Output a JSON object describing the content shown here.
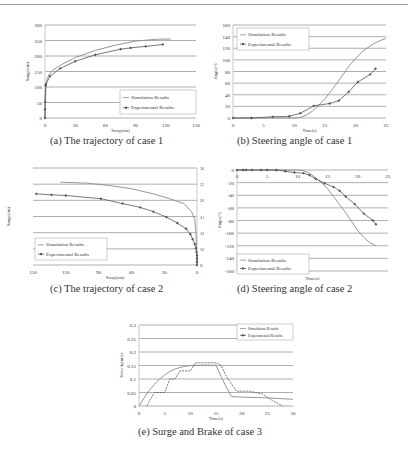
{
  "captions": {
    "a": "(a)  The trajectory of case 1",
    "b": "(b)  Steering angle of case 1",
    "c": "(c)  The trajectory of case 2",
    "d": "(d)  Steering angle of case 2",
    "e": "(e)  Surge and Brake of case 3"
  },
  "legend": {
    "sim": "Simulation Results",
    "exp": "Experimental Results"
  },
  "colors": {
    "simulation": "#8a8a8a",
    "experimental": "#555555",
    "grid": "#9a9a9a",
    "axis": "#bbbbbb"
  },
  "chart_data": [
    {
      "id": "a",
      "type": "line",
      "title": "The trajectory of case 1",
      "xlabel": "Sway(cm)",
      "ylabel": "Surge(cm)",
      "xlim": [
        0,
        150
      ],
      "ylim": [
        0,
        300
      ],
      "xticks": [
        0,
        30,
        60,
        90,
        120,
        150
      ],
      "yticks": [
        0,
        50,
        100,
        150,
        200,
        250,
        300
      ],
      "grid": "horizontal",
      "legend_position": "lower right",
      "series": [
        {
          "name": "Simulation Results",
          "marker": "none",
          "x": [
            0,
            0.5,
            1,
            2,
            4,
            8,
            15,
            30,
            50,
            70,
            90,
            110,
            125
          ],
          "y": [
            0,
            60,
            100,
            125,
            140,
            155,
            170,
            195,
            218,
            235,
            248,
            254,
            255
          ]
        },
        {
          "name": "Experimental Results",
          "marker": "diamond",
          "x": [
            0,
            0,
            0,
            0.5,
            1,
            5,
            15,
            30,
            50,
            75,
            85,
            100,
            117
          ],
          "y": [
            0,
            28,
            52,
            105,
            110,
            135,
            160,
            183,
            204,
            222,
            226,
            231,
            237
          ]
        }
      ]
    },
    {
      "id": "b",
      "type": "line",
      "title": "Steering angle of case 1",
      "xlabel": "Time(s)",
      "ylabel": "Angle(°)",
      "xlim": [
        0,
        25
      ],
      "ylim": [
        0,
        160
      ],
      "xticks": [
        0,
        5,
        10,
        15,
        20,
        25
      ],
      "yticks": [
        0,
        20,
        40,
        60,
        80,
        100,
        120,
        140,
        160
      ],
      "grid": "horizontal",
      "legend_position": "upper left",
      "series": [
        {
          "name": "Simulation Results",
          "marker": "none",
          "x": [
            0,
            5,
            10,
            11,
            12,
            13,
            14,
            15,
            16,
            17,
            18,
            19,
            20,
            21,
            22,
            23,
            24,
            25
          ],
          "y": [
            0,
            0,
            0,
            1,
            5,
            12,
            22,
            33,
            46,
            60,
            75,
            90,
            102,
            113,
            121,
            128,
            133,
            137
          ]
        },
        {
          "name": "Experimental Results",
          "marker": "diamond",
          "x": [
            0,
            3,
            6.5,
            9.2,
            11,
            13.2,
            15.8,
            17.3,
            18.9,
            20.4,
            22.4,
            23.3
          ],
          "y": [
            0,
            0,
            2,
            3,
            8,
            21,
            25,
            30,
            45,
            62,
            75,
            85
          ]
        }
      ]
    },
    {
      "id": "c",
      "type": "line",
      "title": "The trajectory of case 2",
      "xlabel": "Sway(cm)",
      "ylabel": "Surge(cm)",
      "xlim": [
        150,
        0
      ],
      "ylim": [
        0,
        300
      ],
      "xticks": [
        150,
        120,
        90,
        60,
        30,
        0
      ],
      "xticklabels": [
        "150",
        "120",
        "90",
        "60",
        "30",
        "0"
      ],
      "yticks": [
        0,
        50,
        100,
        150,
        200,
        250,
        300
      ],
      "y_axis_side": "right",
      "grid": "horizontal",
      "legend_position": "lower left",
      "series": [
        {
          "name": "Simulation Results",
          "marker": "none",
          "x": [
            125,
            100,
            80,
            60,
            40,
            25,
            12,
            5,
            2,
            1,
            0.5,
            0
          ],
          "y": [
            256,
            253,
            246,
            236,
            220,
            205,
            190,
            165,
            140,
            100,
            60,
            0
          ]
        },
        {
          "name": "Experimental Results",
          "marker": "diamond",
          "x": [
            147,
            133,
            120,
            88,
            68,
            52,
            40,
            28,
            18,
            10,
            6,
            4,
            2,
            1,
            0.5,
            0,
            0,
            0,
            0
          ],
          "y": [
            220,
            217,
            215,
            205,
            190,
            178,
            165,
            148,
            130,
            112,
            95,
            80,
            65,
            52,
            40,
            30,
            20,
            10,
            0
          ]
        }
      ]
    },
    {
      "id": "d",
      "type": "line",
      "title": "Steering angle of case 2",
      "xlabel": "Time(s)",
      "ylabel": "Angle(°)",
      "xlim": [
        0,
        25
      ],
      "ylim": [
        -160,
        0
      ],
      "xticks": [
        0,
        5,
        10,
        15,
        20,
        25
      ],
      "yticks": [
        0,
        -20,
        -40,
        -60,
        -80,
        -100,
        -120,
        -140,
        -160
      ],
      "grid": "horizontal",
      "legend_position": "lower left",
      "series": [
        {
          "name": "Simulation Results",
          "marker": "none",
          "x": [
            0,
            5,
            10,
            11,
            12,
            13,
            14,
            15,
            16,
            17,
            18,
            19,
            20,
            21,
            22,
            23
          ],
          "y": [
            0,
            0,
            0,
            -1,
            -5,
            -12,
            -20,
            -30,
            -42,
            -55,
            -68,
            -82,
            -96,
            -107,
            -115,
            -120
          ]
        },
        {
          "name": "Experimental Results",
          "marker": "diamond",
          "x": [
            0,
            1,
            1.5,
            2.5,
            4,
            5,
            6.5,
            8,
            9.5,
            11,
            12,
            13,
            14.5,
            16,
            17,
            18,
            19.5,
            21,
            22.5,
            23
          ],
          "y": [
            0,
            0,
            0,
            0,
            0,
            0,
            0,
            -2,
            -4,
            -5,
            -8,
            -14,
            -21,
            -27,
            -33,
            -42,
            -54,
            -69,
            -80,
            -86
          ]
        }
      ]
    },
    {
      "id": "e",
      "type": "line",
      "title": "Surge and Brake of case 3",
      "xlabel": "Time(s)",
      "ylabel": "Velocity(m/s)",
      "xlim": [
        0,
        30
      ],
      "ylim": [
        0,
        0.3
      ],
      "xticks": [
        0,
        5,
        10,
        15,
        20,
        25,
        30
      ],
      "yticks": [
        0,
        0.05,
        0.1,
        0.15,
        0.2,
        0.25,
        0.3
      ],
      "grid": "horizontal",
      "legend_position": "upper right",
      "series": [
        {
          "name": "Simulation Results",
          "marker": "none",
          "x": [
            0,
            1,
            2,
            3,
            4,
            5,
            6,
            7,
            8,
            9,
            10,
            12,
            14,
            15,
            16,
            17,
            18,
            20,
            25,
            30
          ],
          "y": [
            0,
            0.03,
            0.058,
            0.08,
            0.1,
            0.115,
            0.128,
            0.137,
            0.143,
            0.147,
            0.15,
            0.151,
            0.151,
            0.151,
            0.11,
            0.07,
            0.035,
            0.033,
            0.03,
            0.025
          ]
        },
        {
          "name": "Experimental Results",
          "marker": "dash",
          "x": [
            1.5,
            3,
            4,
            5,
            6,
            7,
            8,
            9,
            10,
            11,
            12,
            13,
            14,
            15,
            16,
            17,
            19,
            21.5,
            24,
            26,
            28
          ],
          "y": [
            0,
            0.05,
            0.05,
            0.05,
            0.1,
            0.1,
            0.13,
            0.13,
            0.13,
            0.16,
            0.16,
            0.16,
            0.16,
            0.16,
            0.15,
            0.11,
            0.055,
            0.055,
            0.045,
            0.02,
            0
          ]
        }
      ]
    }
  ]
}
